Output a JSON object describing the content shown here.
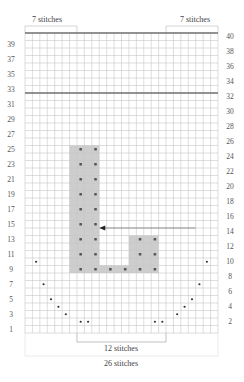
{
  "chart_data": {
    "type": "knitting-chart",
    "columns": 26,
    "rows": 40,
    "left_row_labels": [
      1,
      3,
      5,
      7,
      9,
      11,
      13,
      15,
      17,
      19,
      21,
      23,
      25,
      27,
      29,
      31,
      33,
      35,
      37,
      39
    ],
    "right_row_labels": [
      2,
      4,
      6,
      8,
      10,
      12,
      14,
      16,
      18,
      20,
      22,
      24,
      26,
      28,
      30,
      32,
      34,
      36,
      38,
      40
    ],
    "thick_lines_after_rows": [
      32,
      40
    ],
    "shaded_blocks": [
      {
        "col_start": 7,
        "col_end": 10,
        "row_start": 9,
        "row_end": 25
      },
      {
        "col_start": 11,
        "col_end": 14,
        "row_start": 9,
        "row_end": 9
      },
      {
        "col_start": 15,
        "col_end": 18,
        "row_start": 9,
        "row_end": 13
      }
    ],
    "purl_symbols": [
      {
        "row": 9,
        "cols": [
          8,
          10,
          12,
          14,
          16,
          18
        ]
      },
      {
        "row": 11,
        "cols": [
          8,
          10,
          16,
          18
        ]
      },
      {
        "row": 13,
        "cols": [
          8,
          10,
          16,
          18
        ]
      },
      {
        "row": 15,
        "cols": [
          8,
          10
        ]
      },
      {
        "row": 17,
        "cols": [
          8,
          10
        ]
      },
      {
        "row": 19,
        "cols": [
          8,
          10
        ]
      },
      {
        "row": 21,
        "cols": [
          8,
          10
        ]
      },
      {
        "row": 23,
        "cols": [
          8,
          10
        ]
      },
      {
        "row": 25,
        "cols": [
          8,
          10
        ]
      }
    ],
    "neckline_dots": [
      {
        "row": 10,
        "col": 2
      },
      {
        "row": 7,
        "col": 3
      },
      {
        "row": 5,
        "col": 4
      },
      {
        "row": 4,
        "col": 5
      },
      {
        "row": 3,
        "col": 6
      },
      {
        "row": 2,
        "col": 8
      },
      {
        "row": 2,
        "col": 9
      },
      {
        "row": 2,
        "col": 18
      },
      {
        "row": 2,
        "col": 19
      },
      {
        "row": 3,
        "col": 21
      },
      {
        "row": 4,
        "col": 22
      },
      {
        "row": 5,
        "col": 23
      },
      {
        "row": 7,
        "col": 24
      },
      {
        "row": 10,
        "col": 25
      }
    ],
    "arrow": {
      "row": 14,
      "points_to_col": 11,
      "direction": "left"
    },
    "annotations": {
      "top_left": "7 stitches",
      "top_right": "7 stitches",
      "bottom_center": "12 stitches",
      "bottom_total": "26 stitches"
    }
  },
  "labels": {
    "top_left": "7 stitches",
    "top_right": "7 stitches",
    "bottom_center": "12 stitches",
    "bottom_total": "26 stitches"
  },
  "colors": {
    "grid": "#c8c8c8",
    "thick": "#6e6e6e",
    "shade": "#cdcdcd",
    "dot": "#333333"
  }
}
